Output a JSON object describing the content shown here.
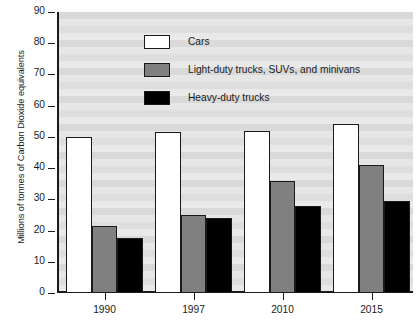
{
  "chart_data": {
    "type": "bar",
    "title": "",
    "xlabel": "",
    "ylabel": "Millions of tonnes of Carbon Dioxide equivalents",
    "ylim": [
      0,
      90
    ],
    "yticks": [
      0,
      10,
      20,
      30,
      40,
      50,
      60,
      70,
      80,
      90
    ],
    "ytick_labels": [
      "0",
      "10",
      "20",
      "30",
      "40",
      "50",
      "60",
      "70",
      "80",
      "90"
    ],
    "categories": [
      "1990",
      "1997",
      "2010",
      "2015"
    ],
    "grid": "horizontal-bands",
    "legend_position": "top-center",
    "series": [
      {
        "name": "Cars",
        "color": "#ffffff",
        "values": [
          50,
          51.7,
          51.8,
          54
        ]
      },
      {
        "name": "Light-duty trucks, SUVs, and minivans",
        "color": "#808080",
        "values": [
          21.5,
          25,
          36,
          41
        ]
      },
      {
        "name": "Heavy-duty trucks",
        "color": "#000000",
        "values": [
          17.5,
          24,
          27.8,
          29.6
        ]
      }
    ]
  },
  "colors": {
    "axis": "#1a1a1a",
    "plot_background": "#e0e0e0",
    "cars": "#ffffff",
    "light_duty": "#808080",
    "heavy_duty": "#000000"
  }
}
